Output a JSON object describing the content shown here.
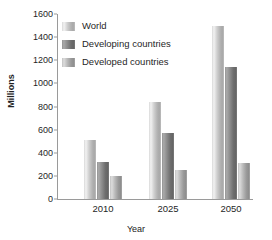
{
  "chart_data": {
    "type": "bar",
    "title": "",
    "xlabel": "Year",
    "ylabel": "Millions",
    "categories": [
      "2010",
      "2025",
      "2050"
    ],
    "series": [
      {
        "name": "World",
        "values": [
          510,
          840,
          1500
        ],
        "color": "#cfcfcf"
      },
      {
        "name": "Developing countries",
        "values": [
          320,
          575,
          1145
        ],
        "color": "#8d8d8d"
      },
      {
        "name": "Developed countries",
        "values": [
          195,
          255,
          310
        ],
        "color": "#b9b9b9"
      }
    ],
    "ylim": [
      0,
      1600
    ],
    "ytick_step": 200,
    "yticks": [
      "1600",
      "1400",
      "1200",
      "1000",
      "800",
      "600",
      "400",
      "200",
      "0"
    ],
    "grid": false,
    "legend_position": "top-left"
  },
  "axes": {
    "y_title": "Millions",
    "x_title": "Year"
  },
  "legend": {
    "items": [
      {
        "label": "World",
        "swatch": "world-swatch"
      },
      {
        "label": "Developing countries",
        "swatch": "developing-swatch"
      },
      {
        "label": "Developed countries",
        "swatch": "developed-swatch"
      }
    ]
  }
}
